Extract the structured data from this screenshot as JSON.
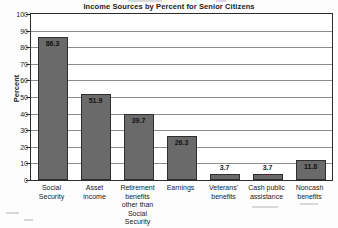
{
  "chart_data": {
    "type": "bar",
    "title": "Income Sources by Percent for Senior Citizens",
    "xlabel": "",
    "ylabel": "Percent",
    "ylim": [
      0,
      100
    ],
    "yticks": [
      0,
      10,
      20,
      30,
      40,
      50,
      60,
      70,
      80,
      90,
      100
    ],
    "grid": true,
    "legend": "none",
    "bar_color": "#6a6a6a",
    "categories": [
      "Social Security",
      "Asset income",
      "Retirement benefits other than Social Security",
      "Earnings",
      "Veterans' benefits",
      "Cash public assistance",
      "Noncash benefits"
    ],
    "values": [
      86.3,
      51.9,
      39.7,
      26.3,
      3.7,
      3.7,
      11.8
    ],
    "value_labels": [
      "86.3",
      "51.9",
      "39.7",
      "26.3",
      "3.7",
      "3.7",
      "11.8"
    ],
    "category_lines": [
      [
        "Social",
        "Security"
      ],
      [
        "Asset",
        "income"
      ],
      [
        "Retirement",
        "benefits",
        "other than",
        "Social Security"
      ],
      [
        "Earnings"
      ],
      [
        "Veterans'",
        "benefits"
      ],
      [
        "Cash public",
        "assistance"
      ],
      [
        "Noncash",
        "benefits"
      ]
    ]
  }
}
